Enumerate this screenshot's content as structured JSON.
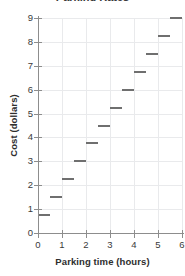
{
  "chart_data": {
    "type": "line",
    "subtype": "step",
    "title": "Parking Rates",
    "xlabel": "Parking time (hours)",
    "ylabel": "Cost (dollars)",
    "xlim": [
      0,
      6
    ],
    "ylim": [
      0,
      9
    ],
    "grid": true,
    "legend": "none",
    "x_ticks": [
      "0",
      "1",
      "2",
      "3",
      "4",
      "5",
      "6"
    ],
    "x_tick_values": [
      0,
      1,
      2,
      3,
      4,
      5,
      6
    ],
    "y_ticks": [
      "0",
      "1",
      "2",
      "3",
      "4",
      "5",
      "6",
      "7",
      "8",
      "9"
    ],
    "y_tick_values": [
      0,
      1,
      2,
      3,
      4,
      5,
      6,
      7,
      8,
      9
    ],
    "series": [
      {
        "name": "Parking cost",
        "color": "#6f6f6f",
        "segments": [
          {
            "x_start": 0.0,
            "x_end": 0.5,
            "value": 0.75
          },
          {
            "x_start": 0.5,
            "x_end": 1.0,
            "value": 1.5
          },
          {
            "x_start": 1.0,
            "x_end": 1.5,
            "value": 2.25
          },
          {
            "x_start": 1.5,
            "x_end": 2.0,
            "value": 3.0
          },
          {
            "x_start": 2.0,
            "x_end": 2.5,
            "value": 3.75
          },
          {
            "x_start": 2.5,
            "x_end": 3.0,
            "value": 4.5
          },
          {
            "x_start": 3.0,
            "x_end": 3.5,
            "value": 5.25
          },
          {
            "x_start": 3.5,
            "x_end": 4.0,
            "value": 6.0
          },
          {
            "x_start": 4.0,
            "x_end": 4.5,
            "value": 6.75
          },
          {
            "x_start": 4.5,
            "x_end": 5.0,
            "value": 7.5
          },
          {
            "x_start": 5.0,
            "x_end": 5.5,
            "value": 8.25
          },
          {
            "x_start": 5.5,
            "x_end": 6.0,
            "value": 9.0
          }
        ]
      }
    ]
  }
}
